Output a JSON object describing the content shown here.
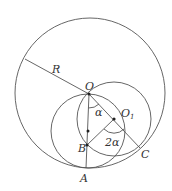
{
  "diagram": {
    "labels": {
      "R": "R",
      "O": "O",
      "O1": "O",
      "O1_sub": "1",
      "B": "B",
      "A": "A",
      "C": "C",
      "alpha": "α",
      "two_alpha": "2α"
    },
    "colors": {
      "stroke": "#555555",
      "text": "#333333"
    }
  }
}
